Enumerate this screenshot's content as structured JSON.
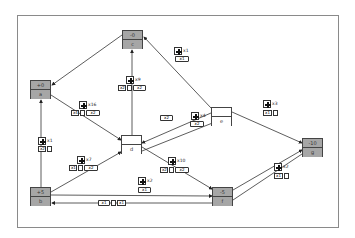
{
  "diagram": {
    "nodes": [
      {
        "id": "a",
        "label": "a",
        "value": "+0",
        "style": "gray",
        "x": 30,
        "y": 80
      },
      {
        "id": "b",
        "label": "b",
        "value": "+5",
        "style": "gray",
        "x": 30,
        "y": 187
      },
      {
        "id": "c",
        "label": "c",
        "value": "-0",
        "style": "gray",
        "x": 122,
        "y": 30
      },
      {
        "id": "d",
        "label": "d",
        "value": "",
        "style": "white",
        "x": 121,
        "y": 135
      },
      {
        "id": "e",
        "label": "e",
        "value": "",
        "style": "white",
        "x": 211,
        "y": 107
      },
      {
        "id": "f",
        "label": "f",
        "value": "-5",
        "style": "gray",
        "x": 212,
        "y": 187
      },
      {
        "id": "g",
        "label": "g",
        "value": "-10",
        "style": "gray",
        "x": 302,
        "y": 138
      }
    ],
    "edges": [
      {
        "from": "c",
        "to": "a",
        "badge": null
      },
      {
        "from": "e",
        "to": "c",
        "badge": {
          "count": "x1",
          "vehicles": [
            "x1"
          ]
        }
      },
      {
        "from": "d",
        "to": "c",
        "badge": {
          "count": "x9",
          "vehicles": [
            "x2",
            "",
            "x2"
          ]
        }
      },
      {
        "from": "a",
        "to": "d",
        "badge": {
          "count": "x16",
          "vehicles": [
            "x4",
            "",
            "x2"
          ]
        }
      },
      {
        "from": "b",
        "to": "a",
        "badge": {
          "count": "x1",
          "vehicles": [
            "x2",
            ""
          ]
        }
      },
      {
        "from": "e",
        "to": "d",
        "badge": {
          "count": "",
          "vehicles": [
            "x2"
          ]
        }
      },
      {
        "from": "f",
        "to": "d",
        "badge": {
          "count": "x4",
          "vehicles": [
            "x2"
          ]
        }
      },
      {
        "from": "b",
        "to": "d",
        "badge": {
          "count": "x7",
          "vehicles": [
            "x1",
            "",
            "x2"
          ]
        }
      },
      {
        "from": "d",
        "to": "f",
        "badge": {
          "count": "x10",
          "vehicles": [
            "x2",
            "",
            "x2"
          ]
        }
      },
      {
        "from": "e",
        "to": "g",
        "badge": {
          "count": "x3",
          "vehicles": [
            "x1",
            ""
          ]
        }
      },
      {
        "from": "f",
        "to": "g",
        "badge": {
          "count": "x2",
          "vehicles": [
            "x1",
            ""
          ]
        }
      },
      {
        "from": "b",
        "to": "f",
        "badge": {
          "count": "x2",
          "vehicles": [
            "x1"
          ]
        }
      },
      {
        "from": "f",
        "to": "b",
        "badge": {
          "count": "",
          "vehicles": [
            "x1",
            "",
            "x1"
          ]
        }
      }
    ]
  },
  "labels": {
    "a_val": "+0",
    "a_lab": "a",
    "b_val": "+5",
    "b_lab": "b",
    "c_val": "-0",
    "c_lab": "c",
    "d_val": "",
    "d_lab": "d",
    "e_val": "",
    "e_lab": "e",
    "f_val": "-5",
    "f_lab": "f",
    "g_val": "-10",
    "g_lab": "g",
    "badge_ec": "x1",
    "veh_ec_1": "x1",
    "badge_dc": "x9",
    "veh_dc_1": "x2",
    "veh_dc_2": "x2",
    "badge_ad": "x16",
    "veh_ad_1": "x4",
    "veh_ad_2": "x2",
    "badge_ba": "x1",
    "veh_ba_1": "x2",
    "veh_ed_1": "x2",
    "badge_fd": "x4",
    "veh_fd_1": "x2",
    "badge_bd": "x7",
    "veh_bd_1": "x1",
    "veh_bd_2": "x2",
    "badge_df": "x10",
    "veh_df_1": "x2",
    "veh_df_2": "x2",
    "badge_eg": "x3",
    "veh_eg_1": "x1",
    "badge_fg": "x2",
    "veh_fg_1": "x1",
    "badge_bf": "x2",
    "veh_bf_1": "x1",
    "veh_fb_1": "x1",
    "veh_fb_2": "x1"
  }
}
